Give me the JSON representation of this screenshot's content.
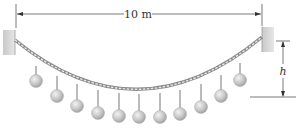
{
  "diagram": {
    "span_label": "10 m",
    "height_label": "h",
    "ball_count": 11,
    "balls": [
      {
        "x": 36,
        "y": 81,
        "hang_from": 66
      },
      {
        "x": 57,
        "y": 96,
        "hang_from": 76
      },
      {
        "x": 77,
        "y": 106,
        "hang_from": 84
      },
      {
        "x": 98,
        "y": 113,
        "hang_from": 90
      },
      {
        "x": 119,
        "y": 116,
        "hang_from": 93
      },
      {
        "x": 139,
        "y": 117,
        "hang_from": 94
      },
      {
        "x": 160,
        "y": 117,
        "hang_from": 93
      },
      {
        "x": 180,
        "y": 114,
        "hang_from": 90
      },
      {
        "x": 201,
        "y": 107,
        "hang_from": 84
      },
      {
        "x": 221,
        "y": 96,
        "hang_from": 75
      },
      {
        "x": 240,
        "y": 80,
        "hang_from": 63
      }
    ],
    "colors": {
      "wall": "#d6d6d6",
      "rope": "#9a9a9a",
      "ball": "#c8c8c8",
      "line": "#555555"
    }
  }
}
